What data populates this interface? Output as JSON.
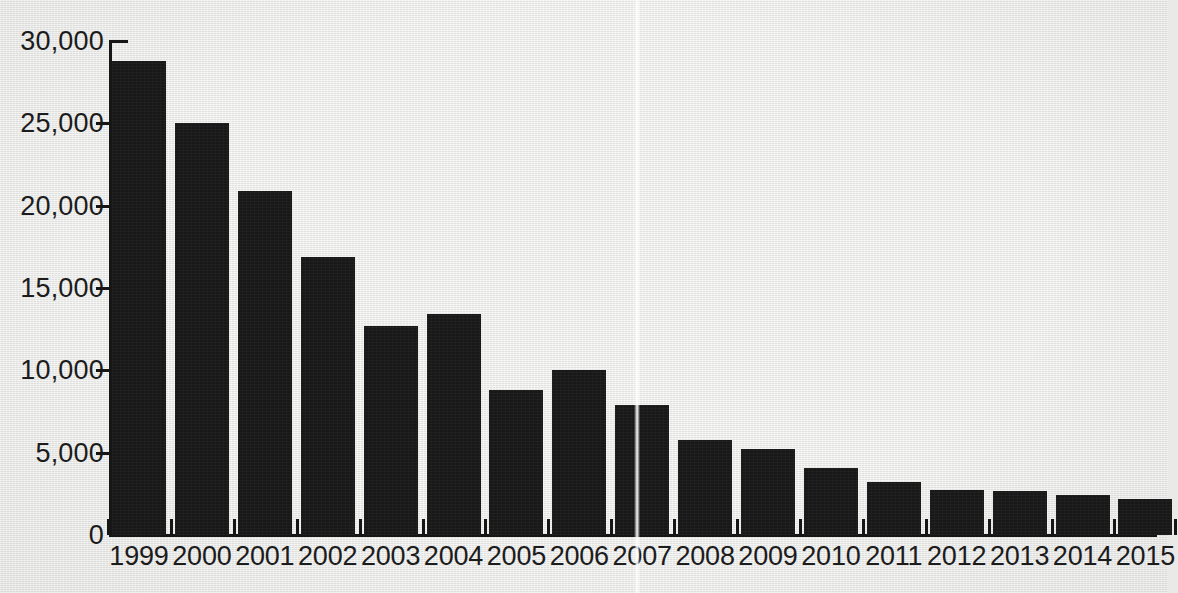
{
  "chart_data": {
    "type": "bar",
    "title": "",
    "subtitle": "",
    "xlabel": "",
    "ylabel": "",
    "categories": [
      "1999",
      "2000",
      "2001",
      "2002",
      "2003",
      "2004",
      "2005",
      "2006",
      "2007",
      "2008",
      "2009",
      "2010",
      "2011",
      "2012",
      "2013",
      "2014",
      "2015"
    ],
    "values": [
      28800,
      25000,
      20900,
      16900,
      12700,
      13400,
      8800,
      10000,
      7900,
      5800,
      5200,
      4100,
      3200,
      2750,
      2650,
      2400,
      2200
    ],
    "ylim": [
      0,
      30000
    ],
    "yticks": [
      0,
      5000,
      10000,
      15000,
      20000,
      25000,
      30000
    ],
    "ytick_labels": [
      "0",
      "5,000",
      "10,000",
      "15,000",
      "20,000",
      "25,000",
      "30,000"
    ],
    "grid": false,
    "legend": false,
    "legend_position": "none",
    "annotations": [],
    "series": [
      {
        "name": "",
        "values": [
          28800,
          25000,
          20900,
          16900,
          12700,
          13400,
          8800,
          10000,
          7900,
          5800,
          5200,
          4100,
          3200,
          2750,
          2650,
          2400,
          2200
        ]
      }
    ]
  },
  "style": {
    "bar_color": "#181818",
    "axis_color": "#161616",
    "text_color": "#1c1c1c",
    "background_color": "#e9e9e7"
  }
}
